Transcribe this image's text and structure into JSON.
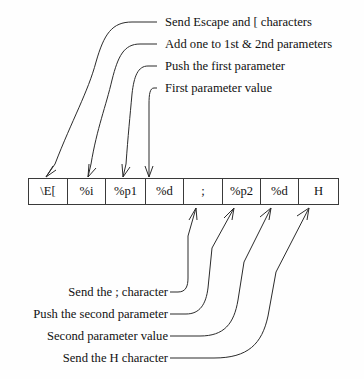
{
  "diagram": {
    "line_color": "#2b2b2b",
    "text_color": "#111111",
    "background_color": "#fefefe"
  },
  "format_string": {
    "cells": [
      {
        "text": "\\E[",
        "width": 39,
        "name": "escape-bracket"
      },
      {
        "text": "%i",
        "width": 38,
        "name": "increment"
      },
      {
        "text": "%p1",
        "width": 40,
        "name": "push-param-1"
      },
      {
        "text": "%d",
        "width": 38,
        "name": "print-param-1"
      },
      {
        "text": ";",
        "width": 39,
        "name": "semicolon"
      },
      {
        "text": "%p2",
        "width": 38,
        "name": "push-param-2"
      },
      {
        "text": "%d",
        "width": 38,
        "name": "print-param-2"
      },
      {
        "text": "H",
        "width": 39,
        "name": "letter-h"
      }
    ]
  },
  "top_annotations": [
    {
      "text": "Send Escape and [ characters",
      "target_cell": 0
    },
    {
      "text": "Add one to 1st & 2nd parameters",
      "target_cell": 1
    },
    {
      "text": "Push the first parameter",
      "target_cell": 2
    },
    {
      "text": "First parameter value",
      "target_cell": 3
    }
  ],
  "bottom_annotations": [
    {
      "text": "Send the ; character",
      "target_cell": 4
    },
    {
      "text": "Push the second parameter",
      "target_cell": 5
    },
    {
      "text": "Second parameter value",
      "target_cell": 6
    },
    {
      "text": "Send the H character",
      "target_cell": 7
    }
  ]
}
